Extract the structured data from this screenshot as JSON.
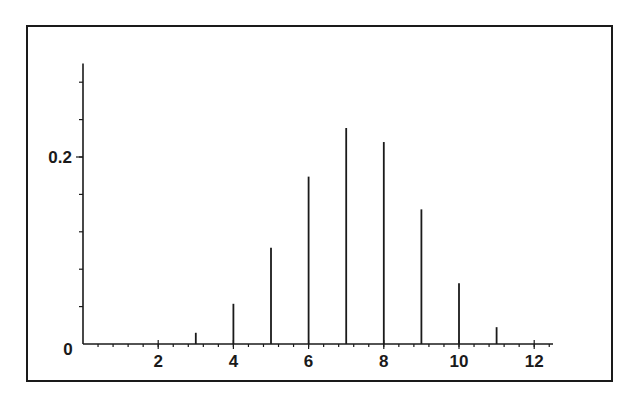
{
  "chart_data": {
    "type": "bar",
    "style": "stem",
    "title": "",
    "xlabel": "",
    "ylabel": "",
    "x": [
      3,
      4,
      5,
      6,
      7,
      8,
      9,
      10,
      11
    ],
    "values": [
      0.012,
      0.043,
      0.103,
      0.179,
      0.231,
      0.216,
      0.144,
      0.065,
      0.018
    ],
    "xlim": [
      0,
      12.5
    ],
    "ylim": [
      0,
      0.3
    ],
    "x_ticks": [
      2,
      4,
      6,
      8,
      10,
      12
    ],
    "x_tick_labels": [
      "2",
      "4",
      "6",
      "8",
      "10",
      "12"
    ],
    "x_minor_step": 0.4,
    "y_ticks": [
      0,
      0.2
    ],
    "y_tick_labels": [
      "0",
      "0.2"
    ],
    "y_minor_step": 0.04,
    "grid": false,
    "legend": null,
    "colors": {
      "ink": "#1a1a1a",
      "background": "#ffffff"
    }
  }
}
